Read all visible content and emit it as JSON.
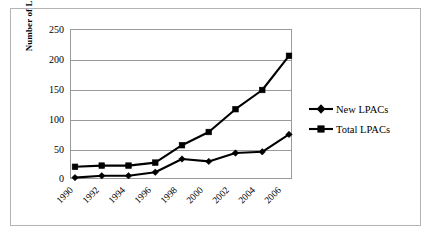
{
  "chart_data": {
    "type": "line",
    "title": "",
    "xlabel": "",
    "ylabel": "Number of LPACs",
    "categories": [
      "1990",
      "1992",
      "1994",
      "1996",
      "1998",
      "2000",
      "2002",
      "2004",
      "2006"
    ],
    "series": [
      {
        "name": "New LPACs",
        "marker": "diamond",
        "color": "#000000",
        "values": [
          4,
          7,
          7,
          13,
          35,
          31,
          45,
          47,
          76
        ]
      },
      {
        "name": "Total LPACs",
        "marker": "square",
        "color": "#000000",
        "values": [
          22,
          24,
          24,
          29,
          58,
          80,
          118,
          150,
          207
        ]
      }
    ],
    "ylim": [
      0,
      250
    ],
    "yticks": [
      0,
      50,
      100,
      150,
      200,
      250
    ],
    "ytick_labels": [
      "0",
      "50",
      "100",
      "150",
      "200",
      "250"
    ],
    "grid": "horizontal",
    "legend_position": "right",
    "x_tick_rotation": -45
  },
  "legend": {
    "items": [
      {
        "label": "New LPACs",
        "marker": "diamond-icon"
      },
      {
        "label": "Total LPACs",
        "marker": "square-icon"
      }
    ]
  }
}
